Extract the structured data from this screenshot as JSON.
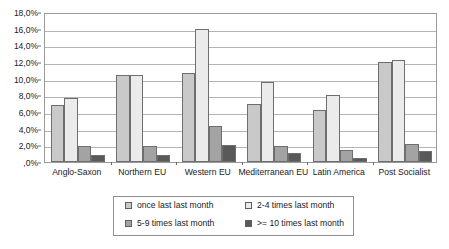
{
  "chart_data": {
    "type": "bar",
    "title": "",
    "subtitle": "",
    "xlabel": "",
    "ylabel": "",
    "ylim": [
      0,
      18
    ],
    "ytick_labels": [
      "18,0%",
      "16,0%",
      "14,0%",
      "12,0%",
      "10,0%",
      "8,0%",
      "6,0%",
      "4,0%",
      "2,0%",
      ",0%"
    ],
    "ytick_values": [
      18,
      16,
      14,
      12,
      10,
      8,
      6,
      4,
      2,
      0
    ],
    "grid": true,
    "legend_position": "bottom",
    "categories": [
      "Anglo-Saxon",
      "Northern EU",
      "Western EU",
      "Mediterranean EU",
      "Latin America",
      "Post Socialist"
    ],
    "series": [
      {
        "name": "once last last month",
        "color": "#c9c9c9",
        "values": [
          6.9,
          10.5,
          10.7,
          7.0,
          6.3,
          12.0
        ]
      },
      {
        "name": "2-4 times last month",
        "color": "#ebebeb",
        "values": [
          7.7,
          10.5,
          16.0,
          9.6,
          8.0,
          12.3
        ]
      },
      {
        "name": "5-9 times last month",
        "color": "#a3a3a3",
        "values": [
          1.9,
          1.9,
          4.3,
          1.9,
          1.5,
          2.2
        ]
      },
      {
        "name": ">= 10 times last month",
        "color": "#595959",
        "values": [
          0.8,
          0.9,
          2.1,
          1.1,
          0.5,
          1.3
        ]
      }
    ]
  },
  "legend": {
    "entries": [
      {
        "label": "once last last month",
        "swatch": "#c9c9c9"
      },
      {
        "label": "2-4 times last month",
        "swatch": "#ebebeb"
      },
      {
        "label": "5-9 times last month",
        "swatch": "#a3a3a3"
      },
      {
        "label": ">= 10 times last month",
        "swatch": "#595959"
      }
    ]
  }
}
